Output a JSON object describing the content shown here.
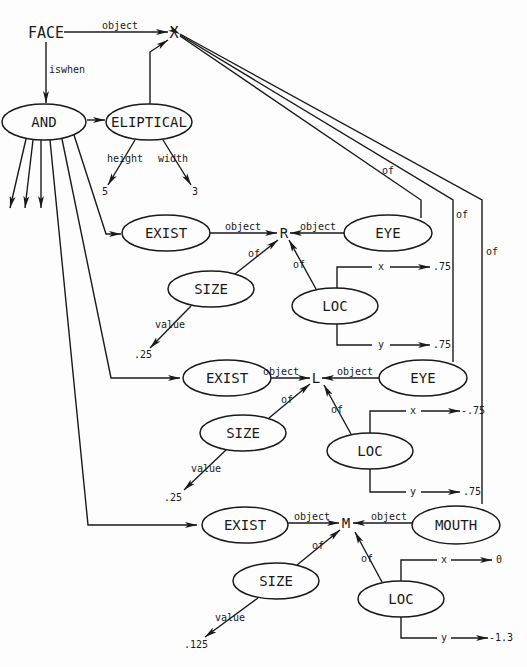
{
  "diagram": {
    "title_node": "FACE",
    "variable_x": "X",
    "nodes": {
      "and": "AND",
      "eliptical": "ELIPTICAL",
      "exist_r": "EXIST",
      "exist_l": "EXIST",
      "exist_m": "EXIST",
      "eye_r": "EYE",
      "eye_l": "EYE",
      "mouth": "MOUTH",
      "size_r": "SIZE",
      "size_l": "SIZE",
      "size_m": "SIZE",
      "loc_r": "LOC",
      "loc_l": "LOC",
      "loc_m": "LOC",
      "var_r": "R",
      "var_l": "L",
      "var_m": "M"
    },
    "edge_labels": {
      "face_to_x": "object",
      "face_to_and": "iswhen",
      "height": "height",
      "width": "width",
      "exist_r_object": "object",
      "eye_r_object": "object",
      "size_r_of": "of",
      "loc_r_of": "of",
      "size_r_value": "value",
      "loc_r_x": "x",
      "loc_r_y": "y",
      "exist_l_object": "object",
      "eye_l_object": "object",
      "size_l_of": "of",
      "loc_l_of": "of",
      "size_l_value": "value",
      "loc_l_x": "x",
      "loc_l_y": "y",
      "exist_m_object": "object",
      "mouth_object": "object",
      "size_m_of": "of",
      "loc_m_of": "of",
      "size_m_value": "value",
      "loc_m_x": "x",
      "loc_m_y": "y",
      "eye_r_of_x": "of",
      "eye_l_of_x": "of",
      "mouth_of_x": "of"
    },
    "values": {
      "height": "5",
      "width": "3",
      "size_r": ".25",
      "loc_r_x": ".75",
      "loc_r_y": ".75",
      "size_l": ".25",
      "loc_l_x": "-.75",
      "loc_l_y": ".75",
      "size_m": ".125",
      "loc_m_x": "0",
      "loc_m_y": "-1.3"
    }
  }
}
